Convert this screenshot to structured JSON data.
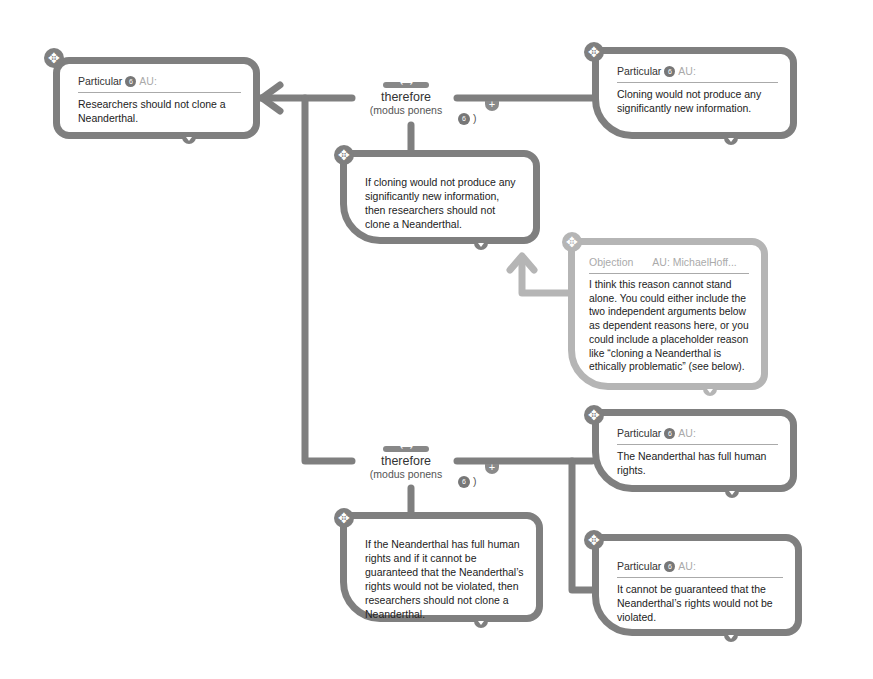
{
  "colors": {
    "line_dark": "#7f7f7f",
    "line_light": "#b5b5b5",
    "background": "#ffffff"
  },
  "conclusion": {
    "type_label": "Particular",
    "badge": "6",
    "author": "AU:",
    "text": "Researchers should not clone a Neanderthal."
  },
  "inference_1": {
    "label": "therefore",
    "scheme": "(modus ponens",
    "badge": "6",
    "close": ")"
  },
  "premise_1": {
    "type_label": "Particular",
    "badge": "6",
    "author": "AU:",
    "text": "Cloning would not produce any significantly new information."
  },
  "premise_1_conditional": {
    "text": "If cloning would not produce any significantly new information, then researchers should not clone a Neanderthal."
  },
  "objection": {
    "type_label": "Objection",
    "author": "AU: MichaelHoff...",
    "text": "I think this reason cannot stand alone. You could either include the two independent arguments below as dependent reasons here, or you could include a placeholder reason like “cloning a Neanderthal is ethically problematic” (see below)."
  },
  "inference_2": {
    "label": "therefore",
    "scheme": "(modus ponens",
    "badge": "6",
    "close": ")"
  },
  "premise_2a": {
    "type_label": "Particular",
    "badge": "6",
    "author": "AU:",
    "text": "The Neanderthal has full human rights."
  },
  "premise_2b": {
    "type_label": "Particular",
    "badge": "6",
    "author": "AU:",
    "text": "It cannot be guaranteed that the Neanderthal’s rights would not be violated."
  },
  "premise_2_conditional": {
    "text": "If the Neanderthal has full human rights and if it cannot be guaranteed that the Neanderthal’s rights would not be violated, then researchers should not clone a Neanderthal."
  }
}
